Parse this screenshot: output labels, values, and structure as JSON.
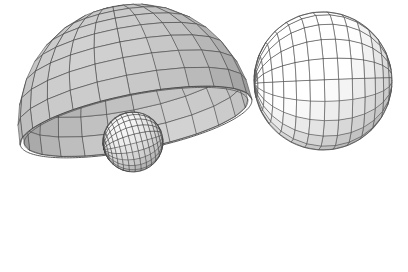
{
  "figure": {
    "title": "Hemispherical bowl with inscribed small sphere and tangent large sphere",
    "caption": "",
    "background_color": "#ffffff",
    "width": 408,
    "height": 272,
    "render_style": "wireframe-mesh-shaded",
    "projection": "orthographic-3d"
  },
  "chart_data": {
    "type": "scatter",
    "title": "Hemispherical bowl with inscribed small sphere and tangent large sphere",
    "xlabel": "",
    "ylabel": "",
    "xlim": [
      0,
      408
    ],
    "ylim": [
      0,
      272
    ],
    "grid": false,
    "legend_position": "none",
    "tick_labels_x": [],
    "tick_labels_y": [],
    "annotations": [],
    "objects": [
      {
        "name": "bowl",
        "label": "hemispherical bowl",
        "shape": "hemisphere-shell",
        "center_x": 136,
        "center_y": 122,
        "radius_x": 118,
        "radius_y": 118,
        "rim_tilt_deg": -11,
        "rim_semi_minor": 28,
        "fill_color": "#b9b9b9",
        "inner_fill_color": "#bdbdbd",
        "line_color": "#4a4a4a",
        "meridian_count": 24,
        "latitude_count": 9,
        "pole_x": 47,
        "pole_y": 183,
        "tip_x": 253,
        "tip_y": 99
      },
      {
        "name": "small-sphere",
        "label": "small sphere inside bowl",
        "shape": "sphere",
        "center_x": 133,
        "center_y": 142,
        "radius": 30,
        "fill_color": "#dcdcdc",
        "line_color": "#3f3f3f",
        "meridian_count": 22,
        "latitude_count": 16,
        "pole_x": 110,
        "pole_y": 156
      },
      {
        "name": "large-sphere",
        "label": "large sphere tangent at rim",
        "shape": "sphere",
        "center_x": 323,
        "center_y": 81,
        "radius": 69,
        "fill_color": "#f7f7f7",
        "line_color": "#4f4f4f",
        "meridian_count": 20,
        "latitude_count": 15,
        "pole_x": 254,
        "pole_y": 100
      }
    ],
    "values": [],
    "categories": []
  },
  "palette": {
    "background": "#ffffff",
    "bowl_outer": "#b9b9b9",
    "bowl_inner": "#c2c2c2",
    "bowl_line": "#4a4a4a",
    "small_sphere_fill": "#dcdcdc",
    "small_sphere_line": "#3f3f3f",
    "large_sphere_fill": "#f7f7f7",
    "large_sphere_line": "#4f4f4f",
    "highlight": "#ffffff",
    "shadow": "#8f8f8f"
  }
}
